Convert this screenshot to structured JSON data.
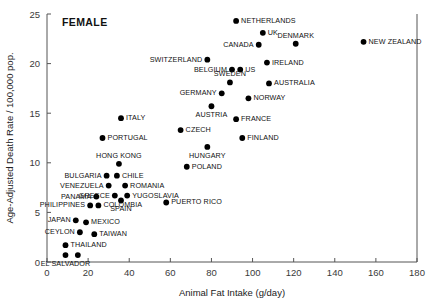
{
  "chart_data": {
    "type": "scatter",
    "title": "FEMALE",
    "xlabel": "Animal Fat Intake (g/day)",
    "ylabel": "Age-Adjusted Death Rate / 100,000 pop.",
    "xlim": [
      0,
      180
    ],
    "ylim": [
      0,
      25
    ],
    "xticks": [
      0,
      20,
      40,
      60,
      80,
      100,
      120,
      140,
      160,
      180
    ],
    "yticks": [
      0,
      5,
      10,
      15,
      20,
      25
    ],
    "grid": false,
    "legend": "none",
    "marker_color": "#000000",
    "axis_color": "#555555",
    "points": [
      {
        "label": "NETHERLANDS",
        "x": 92,
        "y": 24.3,
        "pos": "rgt"
      },
      {
        "label": "UK",
        "x": 105,
        "y": 23.1,
        "pos": "rgt"
      },
      {
        "label": "DENMARK",
        "x": 121,
        "y": 22.0,
        "pos": "abv"
      },
      {
        "label": "CANADA",
        "x": 103,
        "y": 21.9,
        "pos": "lft"
      },
      {
        "label": "NEW ZEALAND",
        "x": 154,
        "y": 22.2,
        "pos": "rgt"
      },
      {
        "label": "IRELAND",
        "x": 107,
        "y": 20.1,
        "pos": "rgt"
      },
      {
        "label": "SWITZERLAND",
        "x": 78,
        "y": 20.4,
        "pos": "lft"
      },
      {
        "label": "BELGIUM",
        "x": 90,
        "y": 19.4,
        "pos": "lft"
      },
      {
        "label": "US",
        "x": 94,
        "y": 19.4,
        "pos": "rgt"
      },
      {
        "label": "SWEDEN",
        "x": 89,
        "y": 18.1,
        "pos": "abv"
      },
      {
        "label": "AUSTRALIA",
        "x": 108,
        "y": 18.0,
        "pos": "rgt"
      },
      {
        "label": "GERMANY",
        "x": 85,
        "y": 17.0,
        "pos": "lft"
      },
      {
        "label": "NORWAY",
        "x": 98,
        "y": 16.5,
        "pos": "rgt"
      },
      {
        "label": "AUSTRIA",
        "x": 80,
        "y": 15.7,
        "pos": "blw"
      },
      {
        "label": "FRANCE",
        "x": 92,
        "y": 14.4,
        "pos": "rgt"
      },
      {
        "label": "ITALY",
        "x": 36,
        "y": 14.5,
        "pos": "rgt"
      },
      {
        "label": "CZECH",
        "x": 65,
        "y": 13.3,
        "pos": "rgt"
      },
      {
        "label": "FINLAND",
        "x": 95,
        "y": 12.5,
        "pos": "rgt"
      },
      {
        "label": "PORTUGAL",
        "x": 27,
        "y": 12.5,
        "pos": "rgt"
      },
      {
        "label": "HUNGARY",
        "x": 78,
        "y": 11.6,
        "pos": "blw"
      },
      {
        "label": "HONG KONG",
        "x": 35,
        "y": 9.9,
        "pos": "abv"
      },
      {
        "label": "POLAND",
        "x": 68,
        "y": 9.6,
        "pos": "rgt"
      },
      {
        "label": "BULGARIA",
        "x": 29,
        "y": 8.7,
        "pos": "lft"
      },
      {
        "label": "CHILE",
        "x": 34,
        "y": 8.7,
        "pos": "rgt"
      },
      {
        "label": "VENEZUELA",
        "x": 30,
        "y": 7.7,
        "pos": "lft"
      },
      {
        "label": "ROMANIA",
        "x": 38,
        "y": 7.7,
        "pos": "rgt"
      },
      {
        "label": "GREECE",
        "x": 33,
        "y": 6.7,
        "pos": "lft"
      },
      {
        "label": "YUGOSLAVIA",
        "x": 39,
        "y": 6.7,
        "pos": "rgt"
      },
      {
        "label": "PANAMA",
        "x": 24,
        "y": 6.6,
        "pos": "lft"
      },
      {
        "label": "SPAIN",
        "x": 36,
        "y": 6.2,
        "pos": "blw"
      },
      {
        "label": "PHILIPPINES",
        "x": 21,
        "y": 5.7,
        "pos": "lft"
      },
      {
        "label": "COLOMBIA",
        "x": 25,
        "y": 5.7,
        "pos": "rgt"
      },
      {
        "label": "PUERTO RICO",
        "x": 58,
        "y": 6.0,
        "pos": "rgt"
      },
      {
        "label": "JAPAN",
        "x": 14,
        "y": 4.2,
        "pos": "lft"
      },
      {
        "label": "MEXICO",
        "x": 19,
        "y": 4.0,
        "pos": "rgt"
      },
      {
        "label": "CEYLON",
        "x": 16,
        "y": 3.0,
        "pos": "lft"
      },
      {
        "label": "TAIWAN",
        "x": 23,
        "y": 2.8,
        "pos": "rgt"
      },
      {
        "label": "THAILAND",
        "x": 9,
        "y": 1.7,
        "pos": "rgt"
      },
      {
        "label": "EL SALVADOR",
        "x": 9,
        "y": 0.7,
        "pos": "blw"
      },
      {
        "label": "",
        "x": 15,
        "y": 0.7,
        "pos": "rgt"
      }
    ]
  }
}
